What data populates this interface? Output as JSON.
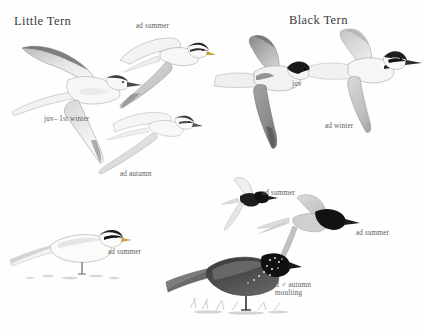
{
  "plate": {
    "kind": "bird-identification-plate",
    "background_color": "#fefefe",
    "width": 424,
    "height": 334,
    "ink_color": "#4a4a4a"
  },
  "titles": [
    {
      "text": "Little Tern",
      "x": 14,
      "y": 14
    },
    {
      "text": "Black Tern",
      "x": 289,
      "y": 13
    }
  ],
  "captions": [
    {
      "id": "little-tern-juv-1st-winter",
      "text": "juv– 1st winter",
      "x": 44,
      "y": 115
    },
    {
      "id": "little-tern-ad-summer-flight",
      "text": "ad summer",
      "x": 136,
      "y": 22
    },
    {
      "id": "little-tern-ad-autumn",
      "text": "ad autumn",
      "x": 120,
      "y": 170
    },
    {
      "id": "little-tern-ad-summer-perched",
      "text": "ad summer",
      "x": 108,
      "y": 248
    },
    {
      "id": "black-tern-juv",
      "text": "juv",
      "x": 292,
      "y": 80
    },
    {
      "id": "black-tern-ad-winter",
      "text": "ad winter",
      "x": 325,
      "y": 122
    },
    {
      "id": "black-tern-ad-summer-upper",
      "text": "ad summer",
      "x": 262,
      "y": 189
    },
    {
      "id": "black-tern-ad-summer-lower",
      "text": "ad summer",
      "x": 356,
      "y": 229
    },
    {
      "id": "black-tern-ad-male-autumn-moulting-line1",
      "text": "ad ♂ autumn",
      "x": 272,
      "y": 281
    },
    {
      "id": "black-tern-ad-male-autumn-moulting-line2",
      "text": "moulting",
      "x": 275,
      "y": 289
    }
  ],
  "figures": [
    {
      "id": "little-tern-juv-flight",
      "label": "juv– 1st winter",
      "species": "Little Tern",
      "pose": "flight",
      "x": 8,
      "y": 40,
      "w": 130,
      "h": 125,
      "body_color": "#f2f2f0",
      "wing_color": "#cfcfcd",
      "cap_color": "#3a3a3a",
      "bill_color": "#4a4a4a"
    },
    {
      "id": "little-tern-ad-summer-flight",
      "label": "ad summer",
      "species": "Little Tern",
      "pose": "flight",
      "x": 110,
      "y": 30,
      "w": 100,
      "h": 80,
      "body_color": "#f4f4f2",
      "wing_color": "#d4d4d2",
      "cap_color": "#232323",
      "bill_color": "#c8a43a"
    },
    {
      "id": "little-tern-ad-autumn-flight",
      "label": "ad autumn",
      "species": "Little Tern",
      "pose": "flight",
      "x": 95,
      "y": 105,
      "w": 105,
      "h": 72,
      "body_color": "#f5f5f3",
      "wing_color": "#dcdcda",
      "cap_color": "#3c3c3c",
      "bill_color": "#555555"
    },
    {
      "id": "little-tern-ad-summer-perched",
      "label": "ad summer",
      "species": "Little Tern",
      "pose": "perched",
      "x": 10,
      "y": 218,
      "w": 120,
      "h": 66,
      "body_color": "#fbfbfa",
      "wing_color": "#e2e2e0",
      "cap_color": "#1c1c1c",
      "bill_color": "#c8a43a"
    },
    {
      "id": "black-tern-juv-flight",
      "label": "juv",
      "species": "Black Tern",
      "pose": "flight",
      "x": 214,
      "y": 36,
      "w": 110,
      "h": 115,
      "body_color": "#f0f0ee",
      "wing_color": "#9a9a98",
      "cap_color": "#1a1a1a",
      "bill_color": "#2c2c2c"
    },
    {
      "id": "black-tern-ad-winter-flight",
      "label": "ad winter",
      "species": "Black Tern",
      "pose": "flight",
      "x": 312,
      "y": 26,
      "w": 110,
      "h": 105,
      "body_color": "#f3f3f1",
      "wing_color": "#b8b8b6",
      "cap_color": "#1e1e1e",
      "bill_color": "#2c2c2c"
    },
    {
      "id": "black-tern-ad-summer-upper",
      "label": "ad summer",
      "species": "Black Tern",
      "pose": "flight",
      "x": 222,
      "y": 178,
      "w": 60,
      "h": 52,
      "body_color": "#efefed",
      "wing_color": "#c6c6c4",
      "cap_color": "#111111",
      "bill_color": "#232323"
    },
    {
      "id": "black-tern-ad-summer-lower",
      "label": "ad summer",
      "species": "Black Tern",
      "pose": "flight",
      "x": 258,
      "y": 196,
      "w": 110,
      "h": 70,
      "body_color": "#ebebe9",
      "wing_color": "#c9c9c7",
      "cap_color": "#121212",
      "bill_color": "#1e1e1e"
    },
    {
      "id": "black-tern-ad-male-autumn-perched",
      "label": "ad ♂ autumn moulting",
      "species": "Black Tern",
      "pose": "perched",
      "x": 166,
      "y": 248,
      "w": 130,
      "h": 72,
      "body_color": "#3d3d3d",
      "wing_color": "#6e6e6e",
      "cap_color": "#101010",
      "bill_color": "#1a1a1a"
    }
  ]
}
